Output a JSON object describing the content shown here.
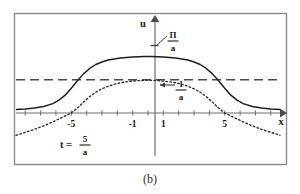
{
  "figure": {
    "caption": "(b)",
    "axis_labels": {
      "y": "u",
      "x": "x"
    },
    "annotations": {
      "amplitude_top": {
        "numerator": "Π",
        "denominator": "a"
      },
      "amplitude_mid": {
        "numerator": "1",
        "denominator": "a"
      },
      "time": {
        "lhs": "t =",
        "numerator": "5",
        "denominator": "a"
      }
    },
    "xticks": [
      {
        "label": "-5",
        "value": -5
      },
      {
        "label": "-1",
        "value": -1
      },
      {
        "label": "1",
        "value": 1
      },
      {
        "label": "5",
        "value": 5
      }
    ],
    "colors": {
      "frame": "#8a8a8a",
      "axis": "#6e6e6e",
      "solid_curve": "#1d1d1d",
      "dotted_curve": "#2a2a2a",
      "dashed_level": "#4a4a4a",
      "text": "#1a1a1a",
      "background": "#ffffff"
    }
  },
  "chart_data": {
    "type": "line",
    "title": "",
    "xlabel": "x",
    "ylabel": "u",
    "xlim": [
      -8.6,
      8.6
    ],
    "ylim": [
      -0.55,
      1.72
    ],
    "grid": false,
    "legend": null,
    "xticks": [
      -5,
      -1,
      1,
      5
    ],
    "xticklabels": [
      "-5",
      "-1",
      "1",
      "5"
    ],
    "annotations": [
      {
        "text": "Π/a",
        "kind": "level-marker",
        "y": 1.45,
        "note": "marker tick on u-axis near top plateau"
      },
      {
        "text": "1/a",
        "kind": "level-marker",
        "y": 0.5,
        "note": "arrow pointing to u-axis at mid level"
      },
      {
        "text": "t = 5/a",
        "kind": "parameter",
        "x": -4.0,
        "y": -0.3
      }
    ],
    "series": [
      {
        "name": "solid-plateau-curve",
        "style": "solid",
        "x": [
          -8.6,
          -8.0,
          -7.4,
          -6.8,
          -6.2,
          -5.8,
          -5.4,
          -5.0,
          -4.6,
          -4.2,
          -3.8,
          -3.4,
          -3.0,
          -2.6,
          -2.2,
          -1.8,
          -1.4,
          -1.0,
          -0.6,
          -0.2,
          0.2,
          0.6,
          1.0,
          1.4,
          1.8,
          2.2,
          2.6,
          3.0,
          3.4,
          3.8,
          4.2,
          4.6,
          5.0,
          5.4,
          5.8,
          6.2,
          6.8,
          7.4,
          8.0,
          8.6
        ],
        "y": [
          0.07,
          0.08,
          0.1,
          0.13,
          0.19,
          0.26,
          0.36,
          0.5,
          0.65,
          0.79,
          0.9,
          0.98,
          1.03,
          1.07,
          1.09,
          1.11,
          1.12,
          1.13,
          1.135,
          1.14,
          1.14,
          1.135,
          1.13,
          1.12,
          1.11,
          1.09,
          1.07,
          1.03,
          0.98,
          0.9,
          0.79,
          0.65,
          0.5,
          0.36,
          0.26,
          0.19,
          0.13,
          0.1,
          0.08,
          0.07
        ]
      },
      {
        "name": "dotted-bell-curve",
        "style": "dotted",
        "x": [
          -8.6,
          -8.0,
          -7.4,
          -6.8,
          -6.2,
          -5.8,
          -5.4,
          -5.0,
          -4.6,
          -4.2,
          -3.8,
          -3.4,
          -3.0,
          -2.6,
          -2.2,
          -1.8,
          -1.4,
          -1.0,
          -0.6,
          -0.2,
          0.2,
          0.6,
          1.0,
          1.4,
          1.8,
          2.2,
          2.6,
          3.0,
          3.4,
          3.8,
          4.2,
          4.6,
          5.0,
          5.4,
          5.8,
          6.2,
          6.8,
          7.4,
          8.0,
          8.6
        ],
        "y": [
          -0.45,
          -0.39,
          -0.33,
          -0.26,
          -0.18,
          -0.12,
          -0.06,
          0.0,
          0.1,
          0.22,
          0.33,
          0.42,
          0.49,
          0.54,
          0.58,
          0.61,
          0.63,
          0.645,
          0.655,
          0.66,
          0.66,
          0.655,
          0.645,
          0.63,
          0.61,
          0.58,
          0.54,
          0.49,
          0.42,
          0.33,
          0.22,
          0.1,
          0.0,
          -0.06,
          -0.12,
          -0.18,
          -0.26,
          -0.33,
          -0.39,
          -0.45
        ]
      },
      {
        "name": "dashed-asymptote-level",
        "style": "dashed",
        "x": [
          -8.6,
          8.6
        ],
        "y": [
          0.67,
          0.67
        ]
      }
    ]
  }
}
